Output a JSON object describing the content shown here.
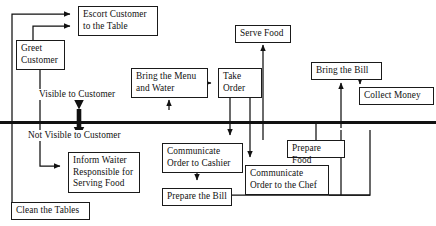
{
  "diagram": {
    "type": "service-blueprint-flowchart",
    "line_of_visibility": {
      "above_label": "Visible to Customer",
      "below_label": "Not Visible to Customer",
      "y": 122
    },
    "colors": {
      "stroke": "#111111",
      "background": "#ffffff",
      "box_border": "#1a1a1a"
    },
    "nodes": [
      {
        "id": "escort",
        "label": "Escort Customer to the Table",
        "x": 78,
        "y": 6,
        "w": 80,
        "h": 30,
        "zone": "visible"
      },
      {
        "id": "greet",
        "label": "Greet Customer",
        "x": 16,
        "y": 40,
        "w": 49,
        "h": 30,
        "zone": "visible"
      },
      {
        "id": "bring_menu",
        "label": "Bring the Menu and Water",
        "x": 131,
        "y": 68,
        "w": 77,
        "h": 30,
        "zone": "visible"
      },
      {
        "id": "take_order",
        "label": "Take Order",
        "x": 218,
        "y": 68,
        "w": 44,
        "h": 30,
        "zone": "visible"
      },
      {
        "id": "serve_food",
        "label": "Serve Food",
        "x": 235,
        "y": 25,
        "w": 56,
        "h": 18,
        "zone": "visible"
      },
      {
        "id": "bring_bill",
        "label": "Bring the Bill",
        "x": 311,
        "y": 62,
        "w": 71,
        "h": 18,
        "zone": "visible"
      },
      {
        "id": "collect_money",
        "label": "Collect Money",
        "x": 359,
        "y": 87,
        "w": 75,
        "h": 18,
        "zone": "visible"
      },
      {
        "id": "inform_waiter",
        "label": "Inform Waiter Responsible for Serving Food",
        "x": 68,
        "y": 152,
        "w": 72,
        "h": 41,
        "zone": "not-visible"
      },
      {
        "id": "comm_cashier",
        "label": "Communicate Order to Cashier",
        "x": 162,
        "y": 143,
        "w": 81,
        "h": 30,
        "zone": "not-visible"
      },
      {
        "id": "prepare_bill",
        "label": "Prepare the Bill",
        "x": 162,
        "y": 188,
        "w": 70,
        "h": 18,
        "zone": "not-visible"
      },
      {
        "id": "comm_chef",
        "label": "Communicate Order to the Chef",
        "x": 245,
        "y": 165,
        "w": 84,
        "h": 30,
        "zone": "not-visible"
      },
      {
        "id": "prepare_food",
        "label": "Prepare Food",
        "x": 287,
        "y": 140,
        "w": 58,
        "h": 18,
        "zone": "not-visible"
      },
      {
        "id": "clean_tables",
        "label": "Clean the Tables",
        "x": 11,
        "y": 202,
        "w": 79,
        "h": 18,
        "zone": "not-visible"
      }
    ]
  }
}
